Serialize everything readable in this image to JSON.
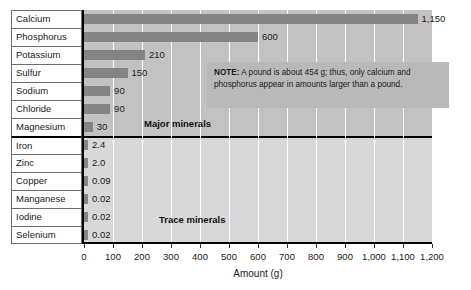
{
  "chart_data": {
    "type": "bar",
    "title": "",
    "orientation": "horizontal",
    "xlabel": "Amount (g)",
    "ylabel": "",
    "xlim": [
      0,
      1200
    ],
    "xticks": [
      0,
      100,
      200,
      300,
      400,
      500,
      600,
      700,
      800,
      900,
      1000,
      1100,
      1200
    ],
    "xtick_labels": [
      "0",
      "100",
      "200",
      "300",
      "400",
      "500",
      "600",
      "700",
      "800",
      "900",
      "1,000",
      "1,100",
      "1,200"
    ],
    "grid": "vertical-white",
    "legend": "none",
    "categories": [
      "Calcium",
      "Phosphorus",
      "Potassium",
      "Sulfur",
      "Sodium",
      "Chloride",
      "Magnesium",
      "Iron",
      "Zinc",
      "Copper",
      "Manganese",
      "Iodine",
      "Selenium"
    ],
    "values": [
      1150,
      600,
      210,
      150,
      90,
      90,
      30,
      2.4,
      2.0,
      0.09,
      0.02,
      0.02,
      0.02
    ],
    "value_labels": [
      "1,150",
      "600",
      "210",
      "150",
      "90",
      "90",
      "30",
      "2.4",
      "2.0",
      "0.09",
      "0.02",
      "0.02",
      "0.02"
    ],
    "groups": [
      {
        "name": "Major minerals",
        "categories": [
          "Calcium",
          "Phosphorus",
          "Potassium",
          "Sulfur",
          "Sodium",
          "Chloride",
          "Magnesium"
        ]
      },
      {
        "name": "Trace minerals",
        "categories": [
          "Iron",
          "Zinc",
          "Copper",
          "Manganese",
          "Iodine",
          "Selenium"
        ]
      }
    ],
    "annotations": [
      {
        "name": "note",
        "text": "NOTE: A pound is about 454 g; thus, only calcium and phosphorus appear in amounts larger than a pound."
      }
    ],
    "colors": {
      "bar": "#848484",
      "plot_background_major": "#c2c2c2",
      "plot_background_trace": "#d8d8d8",
      "gridline": "#ffffff",
      "axis": "#000000",
      "note_background": "#b9b9b9",
      "text": "#1a1a1a"
    }
  },
  "rows": [
    {
      "label": "Calcium",
      "value_label": "1,150"
    },
    {
      "label": "Phosphorus",
      "value_label": "600"
    },
    {
      "label": "Potassium",
      "value_label": "210"
    },
    {
      "label": "Sulfur",
      "value_label": "150"
    },
    {
      "label": "Sodium",
      "value_label": "90"
    },
    {
      "label": "Chloride",
      "value_label": "90"
    },
    {
      "label": "Magnesium",
      "value_label": "30"
    },
    {
      "label": "Iron",
      "value_label": "2.4"
    },
    {
      "label": "Zinc",
      "value_label": "2.0"
    },
    {
      "label": "Copper",
      "value_label": "0.09"
    },
    {
      "label": "Manganese",
      "value_label": "0.02"
    },
    {
      "label": "Iodine",
      "value_label": "0.02"
    },
    {
      "label": "Selenium",
      "value_label": "0.02"
    }
  ],
  "captions": {
    "major": "Major minerals",
    "trace": "Trace minerals"
  },
  "note": {
    "prefix": "NOTE:",
    "body": " A pound is about 454 g; thus, only calcium and phosphorus appear in amounts larger than a pound."
  },
  "axis": {
    "title": "Amount (g)",
    "tick_labels": [
      "0",
      "100",
      "200",
      "300",
      "400",
      "500",
      "600",
      "700",
      "800",
      "900",
      "1,000",
      "1,100",
      "1,200"
    ]
  }
}
